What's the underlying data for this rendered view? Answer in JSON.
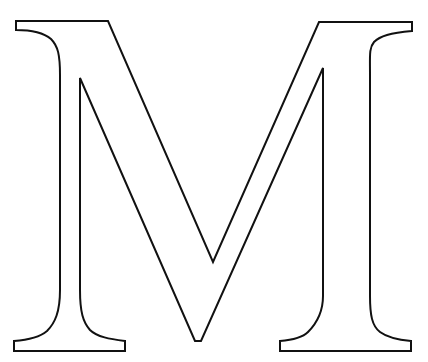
{
  "figure": {
    "letter": "M",
    "stroke_color": "#111111",
    "fill_color": "#ffffff",
    "background": "#ffffff"
  }
}
